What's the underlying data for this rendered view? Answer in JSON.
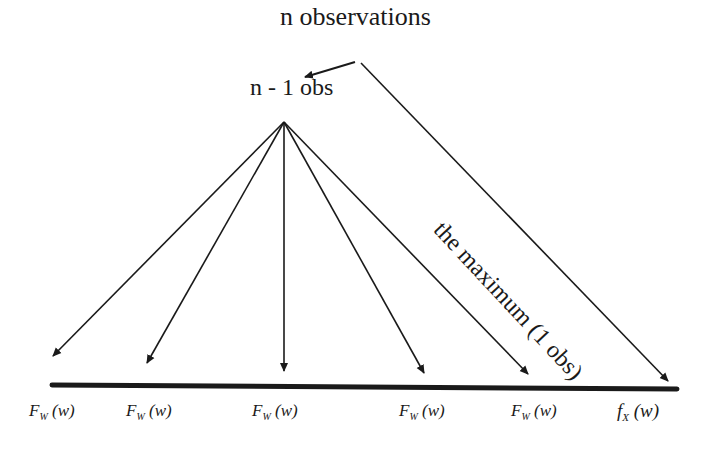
{
  "diagram": {
    "root_label": "n observations",
    "subset_label": "n - 1 obs",
    "max_edge_label": "the maximum (1 obs)",
    "leaves": [
      {
        "func": "F",
        "sub": "W",
        "arg": "(w)"
      },
      {
        "func": "F",
        "sub": "W",
        "arg": "(w)"
      },
      {
        "func": "F",
        "sub": "W",
        "arg": "(w)"
      },
      {
        "func": "F",
        "sub": "W",
        "arg": "(w)"
      },
      {
        "func": "F",
        "sub": "W",
        "arg": "(w)"
      },
      {
        "func": "f",
        "sub": "X",
        "arg": "(w)"
      }
    ],
    "colors": {
      "line": "#1a1a1a",
      "background": "#ffffff"
    }
  }
}
